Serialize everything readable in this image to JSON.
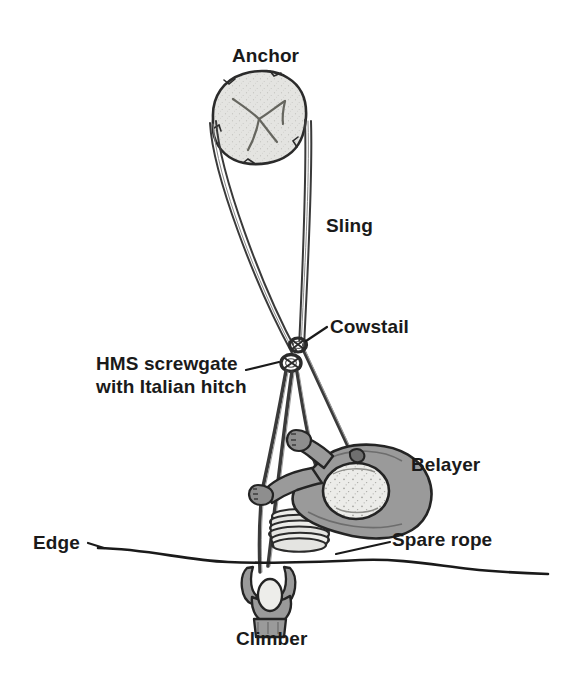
{
  "diagram": {
    "background_color": "#ffffff",
    "ink_color": "#1a1a1a",
    "body_fill": "#9a9a9a",
    "helmet_fill": "#e8e8e6",
    "rock_fill": "#dcdcda",
    "rope_fill": "#6f6f6f",
    "labels": {
      "anchor": "Anchor",
      "sling": "Sling",
      "cowstail": "Cowstail",
      "hms_line1": "HMS screwgate",
      "hms_line2": "with Italian hitch",
      "belayer": "Belayer",
      "edge": "Edge",
      "spare_rope": "Spare rope",
      "climber": "Climber"
    }
  }
}
